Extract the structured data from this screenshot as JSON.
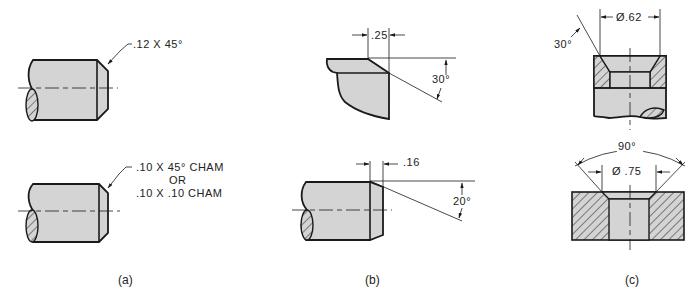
{
  "figure": {
    "panel_a": {
      "caption": "(a)",
      "top_note": ".12 X 45°",
      "bottom_note_line1": ".10 X 45° CHAM",
      "bottom_note_line2": "OR",
      "bottom_note_line3": ".10 X .10 CHAM"
    },
    "panel_b": {
      "caption": "(b)",
      "top_dim": ".25",
      "top_angle": "30°",
      "bottom_dim": ".16",
      "bottom_angle": "20°"
    },
    "panel_c": {
      "caption": "(c)",
      "top_angle": "30°",
      "top_diameter": "Ø.62",
      "bottom_angle": "90°",
      "bottom_diameter": "Ø .75"
    }
  },
  "colors": {
    "fill": "#d4d4d4",
    "line": "#1a1a1a",
    "background": "#ffffff"
  }
}
